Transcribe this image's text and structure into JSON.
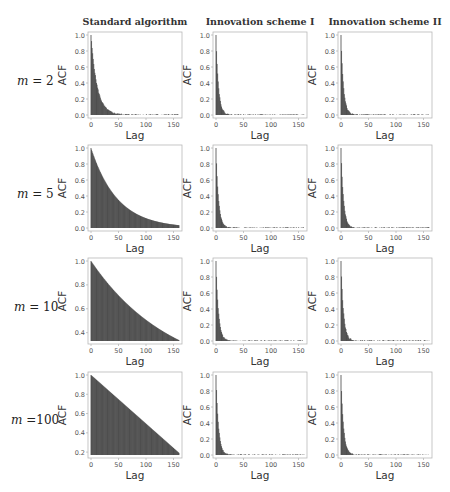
{
  "column_titles": [
    "Standard algorithm",
    "Innovation scheme I",
    "Innovation scheme II"
  ],
  "row_labels": [
    "m = 2",
    "m = 5",
    "m = 10",
    "m =100"
  ],
  "row_label_parts": [
    {
      "var": "m",
      "eq": " = ",
      "val": "2"
    },
    {
      "var": "m",
      "eq": " = ",
      "val": "5"
    },
    {
      "var": "m",
      "eq": " = ",
      "val": "10"
    },
    {
      "var": "m",
      "eq": " =",
      "val": "100"
    }
  ],
  "axis": {
    "xlabel": "Lag",
    "ylabel": "ACF",
    "xticks": [
      0,
      50,
      100,
      150
    ],
    "xlim": [
      0,
      160
    ]
  },
  "colors": {
    "bar": "#3a3a3a",
    "frame": "#b8b8b8",
    "tick_text": "#555555"
  },
  "chart_data": [
    {
      "type": "bar",
      "title": "Standard algorithm, m = 2",
      "xlabel": "Lag",
      "ylabel": "ACF",
      "ylim": [
        0,
        1.0
      ],
      "yticks": [
        0.0,
        0.2,
        0.4,
        0.6,
        0.8,
        1.0
      ],
      "decay": "exponential",
      "rate": 0.09,
      "tail_noise": 0.01
    },
    {
      "type": "bar",
      "title": "Innovation scheme I, m = 2",
      "xlabel": "Lag",
      "ylabel": "ACF",
      "ylim": [
        0,
        1.0
      ],
      "yticks": [
        0.0,
        0.2,
        0.4,
        0.6,
        0.8,
        1.0
      ],
      "decay": "exponential",
      "rate": 0.22,
      "tail_noise": 0.008
    },
    {
      "type": "bar",
      "title": "Innovation scheme II, m = 2",
      "xlabel": "Lag",
      "ylabel": "ACF",
      "ylim": [
        0,
        1.0
      ],
      "yticks": [
        0.0,
        0.2,
        0.4,
        0.6,
        0.8,
        1.0
      ],
      "decay": "exponential",
      "rate": 0.22,
      "tail_noise": 0.008
    },
    {
      "type": "bar",
      "title": "Standard algorithm, m = 5",
      "xlabel": "Lag",
      "ylabel": "ACF",
      "ylim": [
        0,
        1.0
      ],
      "yticks": [
        0.0,
        0.2,
        0.4,
        0.6,
        0.8,
        1.0
      ],
      "decay": "exponential",
      "rate": 0.021,
      "tail_noise": 0
    },
    {
      "type": "bar",
      "title": "Innovation scheme I, m = 5",
      "xlabel": "Lag",
      "ylabel": "ACF",
      "ylim": [
        0,
        1.0
      ],
      "yticks": [
        0.0,
        0.2,
        0.4,
        0.6,
        0.8,
        1.0
      ],
      "decay": "exponential",
      "rate": 0.22,
      "tail_noise": 0.008
    },
    {
      "type": "bar",
      "title": "Innovation scheme II, m = 5",
      "xlabel": "Lag",
      "ylabel": "ACF",
      "ylim": [
        0,
        1.0
      ],
      "yticks": [
        0.0,
        0.2,
        0.4,
        0.6,
        0.8,
        1.0
      ],
      "decay": "exponential",
      "rate": 0.22,
      "tail_noise": 0.008
    },
    {
      "type": "bar",
      "title": "Standard algorithm, m = 10",
      "xlabel": "Lag",
      "ylabel": "ACF",
      "ylim": [
        0.33,
        1.0
      ],
      "yticks": [
        0.4,
        0.6,
        0.8,
        1.0
      ],
      "decay": "exponential",
      "rate": 0.0068,
      "tail_noise": 0
    },
    {
      "type": "bar",
      "title": "Innovation scheme I, m = 10",
      "xlabel": "Lag",
      "ylabel": "ACF",
      "ylim": [
        0,
        1.0
      ],
      "yticks": [
        0.0,
        0.2,
        0.4,
        0.6,
        0.8,
        1.0
      ],
      "decay": "exponential",
      "rate": 0.22,
      "tail_noise": 0.008
    },
    {
      "type": "bar",
      "title": "Innovation scheme II, m = 10",
      "xlabel": "Lag",
      "ylabel": "ACF",
      "ylim": [
        0,
        1.0
      ],
      "yticks": [
        0.0,
        0.2,
        0.4,
        0.6,
        0.8,
        1.0
      ],
      "decay": "exponential",
      "rate": 0.22,
      "tail_noise": 0.01
    },
    {
      "type": "bar",
      "title": "Standard algorithm, m = 100",
      "xlabel": "Lag",
      "ylabel": "ACF",
      "ylim": [
        0.17,
        1.0
      ],
      "yticks": [
        0.2,
        0.4,
        0.6,
        0.8,
        1.0
      ],
      "decay": "linear",
      "slope": -0.00505,
      "tail_noise": 0
    },
    {
      "type": "bar",
      "title": "Innovation scheme I, m = 100",
      "xlabel": "Lag",
      "ylabel": "ACF",
      "ylim": [
        0,
        1.0
      ],
      "yticks": [
        0.0,
        0.2,
        0.4,
        0.6,
        0.8,
        1.0
      ],
      "decay": "exponential",
      "rate": 0.22,
      "tail_noise": 0.008
    },
    {
      "type": "bar",
      "title": "Innovation scheme II, m = 100",
      "xlabel": "Lag",
      "ylabel": "ACF",
      "ylim": [
        0,
        1.0
      ],
      "yticks": [
        0.0,
        0.2,
        0.4,
        0.6,
        0.8,
        1.0
      ],
      "decay": "exponential",
      "rate": 0.22,
      "tail_noise": 0.008
    }
  ]
}
